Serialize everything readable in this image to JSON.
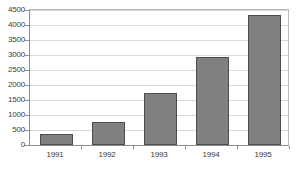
{
  "chart_data": {
    "type": "bar",
    "title": "",
    "subtitle": "",
    "xlabel": "",
    "ylabel": "",
    "categories": [
      "1991",
      "1992",
      "1993",
      "1994",
      "1995"
    ],
    "values": [
      370,
      780,
      1730,
      2950,
      4350
    ],
    "series": [
      {
        "name": "Series 1",
        "values": [
          370,
          780,
          1730,
          2950,
          4350
        ]
      }
    ],
    "ylim": [
      0,
      4500
    ],
    "ytick_values": [
      0,
      500,
      1000,
      1500,
      2000,
      2500,
      3000,
      3500,
      4000,
      4500
    ],
    "ytick_labels": [
      "0",
      "500",
      "1000",
      "1500",
      "2000",
      "2500",
      "3000",
      "3500",
      "4000",
      "4500"
    ],
    "grid": true,
    "grid_axis": "y",
    "legend": false,
    "legend_position": "none",
    "bar_color": "#808080",
    "bar_border_color": "#4d4d4d",
    "gridline_color": "#d9d9d9",
    "axis_color": "#8c8c8c",
    "text_color": "#3b3b3b",
    "background_color": "#ffffff"
  }
}
